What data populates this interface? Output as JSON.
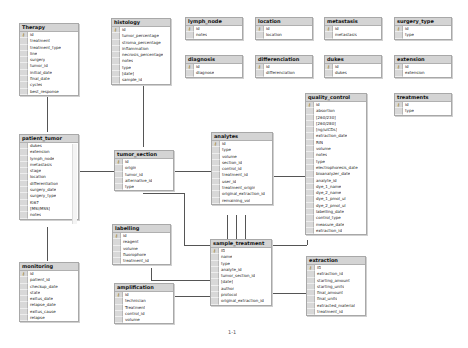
{
  "caption": "1-1",
  "tables": {
    "therapy": {
      "title": "Therapy",
      "fields": [
        "id",
        "treatment",
        "treatment_type",
        "line",
        "surgery",
        "tumor_id",
        "initial_date",
        "final_date",
        "cycles",
        "best_response"
      ]
    },
    "histology": {
      "title": "histology",
      "fields": [
        "id",
        "tumor_percentage",
        "stroma_percentage",
        "inflammation",
        "necrosis_percentage",
        "notes",
        "type",
        "[date]",
        "sample_id"
      ]
    },
    "lymph_node": {
      "title": "lymph_node",
      "fields": [
        "id",
        "notes"
      ]
    },
    "location": {
      "title": "location",
      "fields": [
        "id",
        "location"
      ]
    },
    "metastasis": {
      "title": "metastasis",
      "fields": [
        "id",
        "metastasis"
      ]
    },
    "surgery_type": {
      "title": "surgery_type",
      "fields": [
        "id",
        "type"
      ]
    },
    "diagnosis": {
      "title": "diagnosis",
      "fields": [
        "id",
        "diagnose"
      ]
    },
    "differenciation": {
      "title": "differenciation",
      "fields": [
        "id",
        "differenciation"
      ]
    },
    "dukes": {
      "title": "dukes",
      "fields": [
        "id",
        "dukes"
      ]
    },
    "extension": {
      "title": "extension",
      "fields": [
        "id",
        "extension"
      ]
    },
    "treatments": {
      "title": "treatments",
      "fields": [
        "id",
        "type"
      ]
    },
    "quality_control": {
      "title": "quality_control",
      "fields": [
        "id",
        "absortion",
        "[260/230]",
        "[260/280]",
        "[ng/uICDs]",
        "extraction_date",
        "RIN",
        "volume",
        "notes",
        "type",
        "electrophoresis_date",
        "bioanalyzer_date",
        "analyte_id",
        "dye_1_name",
        "dye_2_name",
        "dye_1_pmol_ul",
        "dye_2_pmol_ul",
        "labelling_date",
        "control_type",
        "measure_date",
        "extraction_id"
      ]
    },
    "patient_tumor": {
      "title": "patient_tumor",
      "fields": [
        "dukes",
        "extension",
        "lymph_node",
        "metastasis",
        "stage",
        "location",
        "differentiation",
        "surgery_date",
        "surgery_type",
        "Ki67",
        "[MSI/MSS]",
        "notes"
      ]
    },
    "tumor_section": {
      "title": "tumor_section",
      "fields": [
        "id",
        "origin",
        "tumor_id",
        "alternative_id",
        "type"
      ]
    },
    "analytes": {
      "title": "analytes",
      "fields": [
        "id",
        "type",
        "volume",
        "section_id",
        "control_id",
        "treatment_id",
        "user_id",
        "treatment_origin",
        "original_extraction_id",
        "remaining_vol"
      ]
    },
    "labelling": {
      "title": "labelling",
      "fields": [
        "id",
        "reagent",
        "volume",
        "fluorophore",
        "treatment_id"
      ]
    },
    "sample_treatment": {
      "title": "sample_treatment",
      "fields": [
        "ID",
        "name",
        "type",
        "analyte_id",
        "tumor_section_id",
        "[date]",
        "author",
        "protocol",
        "original_extraction_id"
      ]
    },
    "amplification": {
      "title": "amplification",
      "fields": [
        "id",
        "technician",
        "Treatment",
        "control_id",
        "volume"
      ]
    },
    "extraction": {
      "title": "extraction",
      "fields": [
        "ID",
        "extraction_id",
        "starting_amount",
        "starting_units",
        "final_amount",
        "final_units",
        "extracted_material",
        "treatment_id"
      ]
    },
    "monitoring": {
      "title": "monitoring",
      "fields": [
        "id",
        "patient_id",
        "checkup_date",
        "state",
        "exitus_date",
        "relapse_date",
        "exitus_cause",
        "relapse"
      ]
    }
  }
}
